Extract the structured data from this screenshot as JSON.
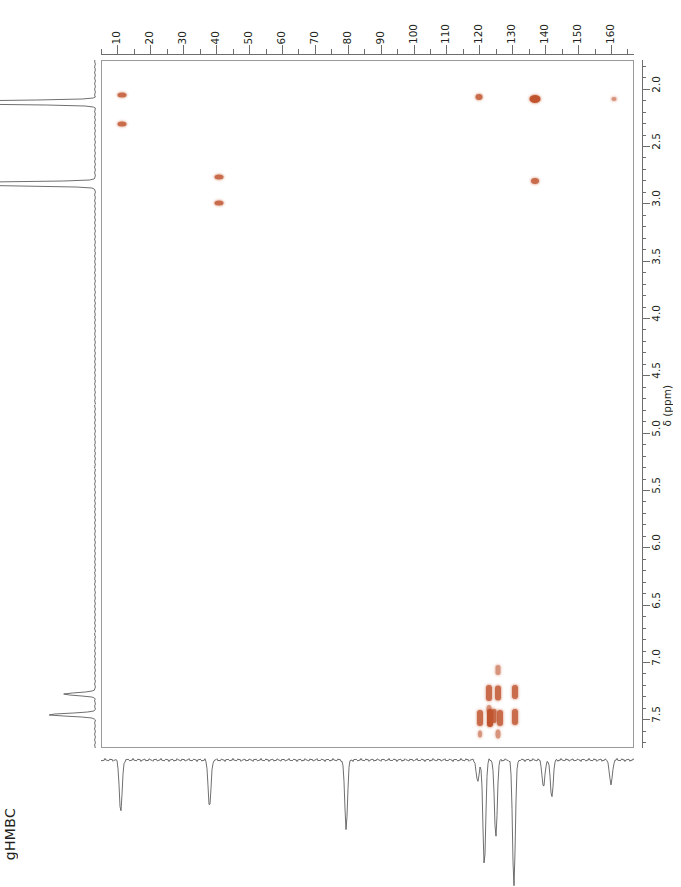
{
  "title": "gHMBC",
  "experiment_label": "gHMBC",
  "colors": {
    "peak": "#c0542e",
    "axis": "#6d6d6d",
    "frame": "#9a9a9a",
    "trace": "#4a4a4a",
    "text": "#231f20"
  },
  "chart_data": {
    "type": "scatter",
    "title": "gHMBC",
    "xlabel": "",
    "ylabel": "δ (ppm)",
    "x_axis": {
      "position": "top",
      "nucleus": "13C",
      "unit": "ppm",
      "direction": "reversed-left-to-right-increasing",
      "xlim": [
        5,
        167
      ],
      "tick_labels": [
        "10",
        "20",
        "30",
        "40",
        "50",
        "60",
        "70",
        "80",
        "90",
        "100",
        "110",
        "120",
        "130",
        "140",
        "150",
        "160"
      ],
      "major_tick_step": 10,
      "minor_tick_step": 5
    },
    "y_axis": {
      "position": "right",
      "nucleus": "1H",
      "unit": "ppm",
      "label": "δ (ppm)",
      "direction": "increasing-downward",
      "ylim": [
        1.75,
        7.75
      ],
      "tick_labels": [
        "2.0",
        "2.5",
        "3.0",
        "3.5",
        "4.0",
        "4.5",
        "5.0",
        "5.5",
        "6.0",
        "6.5",
        "7.0",
        "7.5"
      ],
      "major_tick_step": 0.5,
      "minor_tick_step": 0.1
    },
    "grid": false,
    "legend": null,
    "cross_peaks": [
      {
        "c": 11.0,
        "h": 2.05,
        "w": 9,
        "h_px": 5,
        "intensity": "medium"
      },
      {
        "c": 11.0,
        "h": 2.3,
        "w": 9,
        "h_px": 5,
        "intensity": "medium"
      },
      {
        "c": 40.5,
        "h": 2.76,
        "w": 9,
        "h_px": 5,
        "intensity": "medium"
      },
      {
        "c": 40.5,
        "h": 2.99,
        "w": 9,
        "h_px": 5,
        "intensity": "medium"
      },
      {
        "c": 119.5,
        "h": 2.06,
        "w": 7,
        "h_px": 6,
        "intensity": "medium"
      },
      {
        "c": 136.5,
        "h": 2.08,
        "w": 11,
        "h_px": 8,
        "intensity": "strong"
      },
      {
        "c": 160.5,
        "h": 2.08,
        "w": 5,
        "h_px": 4,
        "intensity": "weak"
      },
      {
        "c": 136.5,
        "h": 2.8,
        "w": 8,
        "h_px": 6,
        "intensity": "medium"
      },
      {
        "c": 125.5,
        "h": 7.06,
        "w": 5,
        "h_px": 10,
        "intensity": "weak"
      },
      {
        "c": 122.5,
        "h": 7.26,
        "w": 6,
        "h_px": 16,
        "intensity": "medium"
      },
      {
        "c": 125.5,
        "h": 7.26,
        "w": 6,
        "h_px": 15,
        "intensity": "medium"
      },
      {
        "c": 130.5,
        "h": 7.25,
        "w": 6,
        "h_px": 14,
        "intensity": "medium"
      },
      {
        "c": 122.5,
        "h": 7.4,
        "w": 5,
        "h_px": 8,
        "intensity": "weak"
      },
      {
        "c": 120.0,
        "h": 7.48,
        "w": 6,
        "h_px": 16,
        "intensity": "medium"
      },
      {
        "c": 122.8,
        "h": 7.48,
        "w": 6,
        "h_px": 18,
        "intensity": "strong"
      },
      {
        "c": 124.0,
        "h": 7.46,
        "w": 5,
        "h_px": 14,
        "intensity": "medium"
      },
      {
        "c": 126.0,
        "h": 7.48,
        "w": 6,
        "h_px": 16,
        "intensity": "medium"
      },
      {
        "c": 130.5,
        "h": 7.47,
        "w": 6,
        "h_px": 16,
        "intensity": "medium"
      },
      {
        "c": 120.0,
        "h": 7.62,
        "w": 4,
        "h_px": 7,
        "intensity": "weak"
      },
      {
        "c": 125.5,
        "h": 7.62,
        "w": 5,
        "h_px": 9,
        "intensity": "weak"
      }
    ],
    "f2_projection_peaks_1h": [
      {
        "shift": 2.12,
        "relative_height": 1.0
      },
      {
        "shift": 2.83,
        "relative_height": 0.95
      },
      {
        "shift": 7.28,
        "relative_height": 0.12
      },
      {
        "shift": 7.46,
        "relative_height": 0.18
      }
    ],
    "f1_projection_peaks_13c": [
      {
        "shift": 11.0,
        "relative_height": 0.42
      },
      {
        "shift": 38.0,
        "relative_height": 0.38
      },
      {
        "shift": 79.5,
        "relative_height": 0.55
      },
      {
        "shift": 119.5,
        "relative_height": 0.18
      },
      {
        "shift": 121.5,
        "relative_height": 0.85
      },
      {
        "shift": 125.0,
        "relative_height": 0.62
      },
      {
        "shift": 130.5,
        "relative_height": 1.0
      },
      {
        "shift": 139.5,
        "relative_height": 0.22
      },
      {
        "shift": 142.0,
        "relative_height": 0.3
      },
      {
        "shift": 160.0,
        "relative_height": 0.2
      }
    ]
  }
}
